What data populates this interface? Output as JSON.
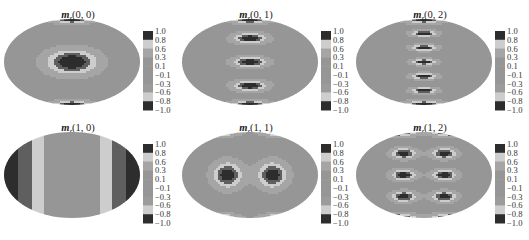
{
  "chart_data": {
    "type": "heatmap",
    "projection": "elliptical (whole-sphere) map",
    "layout": "2 rows x 3 columns",
    "colormap": "grayscale banded: dark = +/-1 extremes, light bands near +/-0.6, mid-gray near 0",
    "colorbar": {
      "range": [
        -1.0,
        1.0
      ],
      "tick_labels": [
        "1.0",
        "0.8",
        "0.6",
        "0.3",
        "0.1",
        "−0.1",
        "−0.3",
        "−0.6",
        "−0.8",
        "−1.0"
      ],
      "tick_values": [
        1.0,
        0.8,
        0.6,
        0.3,
        0.1,
        -0.1,
        -0.3,
        -0.6,
        -0.8,
        -1.0
      ]
    },
    "panels": [
      {
        "id": "p00",
        "title_symbol": "m",
        "title_subscript": "z",
        "title_args": "(0, 0)",
        "l": 0,
        "m": 0,
        "description": "single dark central lobe ringed by a light band; dark caps at top and bottom poles"
      },
      {
        "id": "p01",
        "title_symbol": "m",
        "title_subscript": "z",
        "title_args": "(0, 1)",
        "l": 0,
        "m": 1,
        "description": "three dark lobes stacked vertically along the central meridian; dark caps at poles"
      },
      {
        "id": "p02",
        "title_symbol": "m",
        "title_subscript": "z",
        "title_args": "(0, 2)",
        "l": 0,
        "m": 2,
        "description": "five narrow dark lobes stacked vertically along the central meridian; dark caps at poles"
      },
      {
        "id": "p10",
        "title_symbol": "m",
        "title_subscript": "z",
        "title_args": "(1, 0)",
        "l": 1,
        "m": 0,
        "description": "dark regions at left and right limbs, light vertical bands between, gray centre"
      },
      {
        "id": "p11",
        "title_symbol": "m",
        "title_subscript": "z",
        "title_args": "(1, 1)",
        "l": 1,
        "m": 1,
        "description": "two dark lobes side by side at centre with light rings; four dark corner lobes near poles"
      },
      {
        "id": "p12",
        "title_symbol": "m",
        "title_subscript": "z",
        "title_args": "(1, 2)",
        "l": 1,
        "m": 2,
        "description": "2x3 grid of dark lobes with light rings; dark lobes near poles"
      }
    ]
  }
}
